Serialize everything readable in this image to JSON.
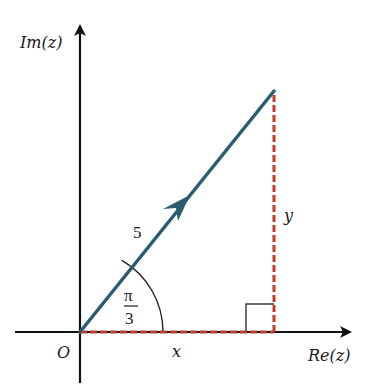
{
  "diagram": {
    "axes": {
      "y_label": "Im(z)",
      "x_label": "Re(z)",
      "origin_label": "O"
    },
    "vector": {
      "modulus_label": "5",
      "angle_label_num": "π",
      "angle_label_den": "3",
      "color": "#2b5d70"
    },
    "components": {
      "x_label": "x",
      "y_label": "y",
      "color": "#c0392b"
    },
    "right_angle_marker": true
  },
  "colors": {
    "axis": "#111111",
    "vector": "#2b5d70",
    "dashed": "#c0392b",
    "arc": "#222222"
  }
}
